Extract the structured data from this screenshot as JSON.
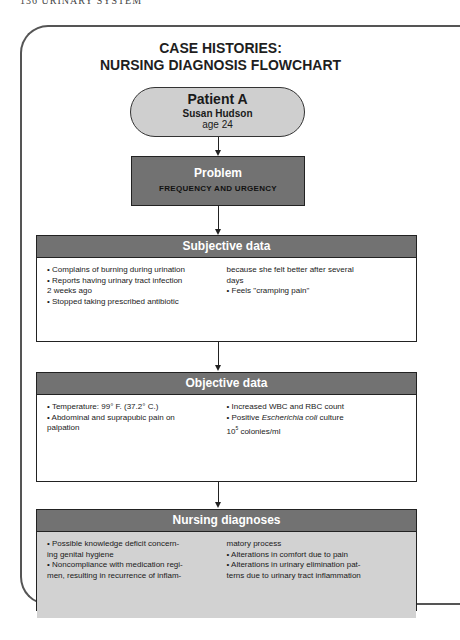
{
  "running_head": "136   URINARY SYSTEM",
  "title": {
    "line1": "CASE HISTORIES:",
    "line2": "NURSING DIAGNOSIS FLOWCHART"
  },
  "patient": {
    "label": "Patient A",
    "name": "Susan Hudson",
    "age": "age 24"
  },
  "problem": {
    "heading": "Problem",
    "value": "FREQUENCY AND URGENCY"
  },
  "subjective": {
    "heading": "Subjective data",
    "left": [
      "• Complains of burning during urination",
      "• Reports having urinary tract infection",
      "2 weeks ago",
      "• Stopped taking prescribed antibiotic"
    ],
    "right": [
      "because she felt better after several",
      "days",
      "• Feels \"cramping pain\""
    ]
  },
  "objective": {
    "heading": "Objective data",
    "left": [
      "• Temperature: 99° F. (37.2° C.)",
      "• Abdominal and suprapubic pain on",
      "palpation"
    ],
    "right": [
      "• Increased WBC and RBC count",
      "• Positive ",
      "Escherichia coli",
      " culture",
      "10",
      "5",
      " colonies/ml"
    ]
  },
  "diagnoses": {
    "heading": "Nursing diagnoses",
    "left": [
      "• Possible knowledge deficit concern-",
      "ing genital hygiene",
      "• Noncompliance with medication regi-",
      "men, resulting in recurrence of inflam-"
    ],
    "right": [
      "matory process",
      "• Alterations in comfort due to pain",
      "• Alterations in urinary elimination pat-",
      "terns due to urinary tract inflammation"
    ]
  },
  "colors": {
    "header_fill": "#727272",
    "pill_fill": "#cfcfcf",
    "diagnoses_fill": "#d2d2d2"
  }
}
